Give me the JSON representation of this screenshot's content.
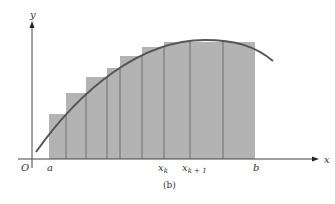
{
  "figure": {
    "caption": "(b)",
    "axes": {
      "x_label": "x",
      "y_label": "y",
      "origin_label": "O"
    },
    "tick_labels": {
      "a": "a",
      "xk": "x",
      "xk_sub": "k",
      "xk1": "x",
      "xk1_sub": "k + 1",
      "b": "b"
    },
    "colors": {
      "rect_fill": "#b3b3b3",
      "rect_line": "#6e6e6e",
      "curve": "#555555",
      "axis": "#444444"
    },
    "rectangles": [
      {
        "x0": 49,
        "x1": 66,
        "top": 114
      },
      {
        "x0": 66,
        "x1": 86,
        "top": 93
      },
      {
        "x0": 86,
        "x1": 107,
        "top": 77
      },
      {
        "x0": 107,
        "x1": 120,
        "top": 68
      },
      {
        "x0": 120,
        "x1": 142,
        "top": 56
      },
      {
        "x0": 142,
        "x1": 164,
        "top": 47
      },
      {
        "x0": 164,
        "x1": 190,
        "top": 42
      },
      {
        "x0": 190,
        "x1": 223,
        "top": 42
      },
      {
        "x0": 223,
        "x1": 255,
        "top": 42
      }
    ]
  }
}
